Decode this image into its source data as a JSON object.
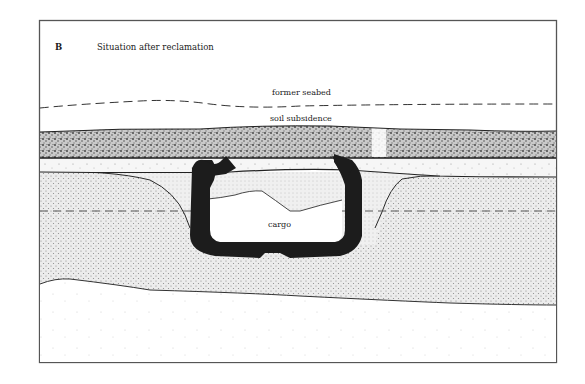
{
  "figure": {
    "panel_letter": "B",
    "title": "Situation after reclamation"
  },
  "labels": {
    "former_seabed": "former seabed",
    "soil_subsidence": "soil subsidence",
    "cargo": "cargo"
  },
  "colors": {
    "background": "#ffffff",
    "frame": "#555555",
    "ink": "#1a1a1a",
    "hull": "#1c1c1c",
    "coarse_band": "#bdbdbd",
    "light_band": "#f1f1f1",
    "fine_fill": "#e2e2e2"
  }
}
